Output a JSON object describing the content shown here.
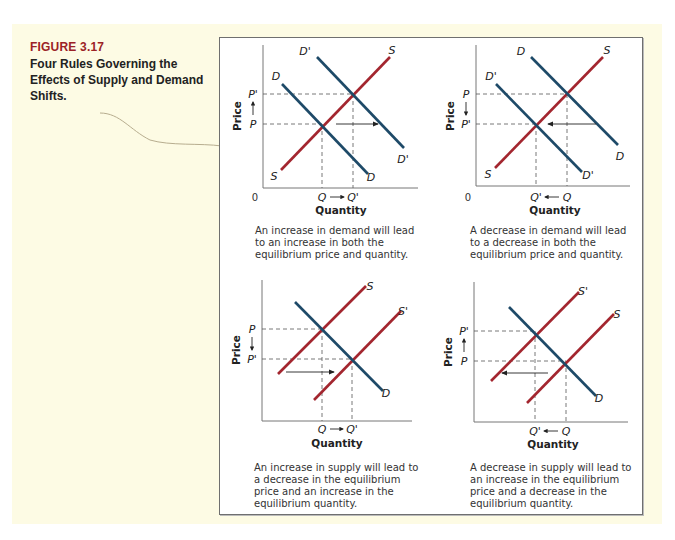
{
  "figure": {
    "number": "FIGURE 3.17",
    "title": "Four Rules Governing the Effects of Supply and Demand Shifts."
  },
  "colors": {
    "supply": "#a3262f",
    "demand": "#1e4a68",
    "figure_number": "#9b2226",
    "background": "#fdfbe4"
  },
  "chart_data": [
    {
      "type": "line",
      "name": "increase-in-demand",
      "xlabel": "Quantity",
      "ylabel": "Price",
      "origin_label": "0",
      "curves": [
        {
          "name": "S",
          "role": "supply",
          "end_labels": [
            "S",
            "S"
          ]
        },
        {
          "name": "D",
          "role": "demand",
          "end_labels": [
            "D",
            "D"
          ]
        },
        {
          "name": "D'",
          "role": "demand",
          "end_labels": [
            "D'",
            "D'"
          ]
        }
      ],
      "price_labels": [
        "P'",
        "P"
      ],
      "price_arrow": "up",
      "quantity_labels": [
        "Q",
        "Q'"
      ],
      "quantity_arrow": "right",
      "shift_arrow": "right",
      "description": "An increase in demand will lead to an increase in both the equilibrium price and quantity."
    },
    {
      "type": "line",
      "name": "decrease-in-demand",
      "xlabel": "Quantity",
      "ylabel": "Price",
      "origin_label": "0",
      "curves": [
        {
          "name": "S",
          "role": "supply",
          "end_labels": [
            "S",
            "S"
          ]
        },
        {
          "name": "D",
          "role": "demand",
          "end_labels": [
            "D",
            "D"
          ]
        },
        {
          "name": "D'",
          "role": "demand",
          "end_labels": [
            "D'",
            "D'"
          ]
        }
      ],
      "price_labels": [
        "P",
        "P'"
      ],
      "price_arrow": "down",
      "quantity_labels": [
        "Q'",
        "Q"
      ],
      "quantity_arrow": "left",
      "shift_arrow": "left",
      "description": "A decrease in demand will lead to a decrease in both the equilibrium price and quantity."
    },
    {
      "type": "line",
      "name": "increase-in-supply",
      "xlabel": "Quantity",
      "ylabel": "Price",
      "curves": [
        {
          "name": "S",
          "role": "supply",
          "end_labels": [
            "S"
          ]
        },
        {
          "name": "S'",
          "role": "supply",
          "end_labels": [
            "S'"
          ]
        },
        {
          "name": "D",
          "role": "demand",
          "end_labels": [
            "D"
          ]
        }
      ],
      "price_labels": [
        "P",
        "P'"
      ],
      "price_arrow": "down",
      "quantity_labels": [
        "Q",
        "Q'"
      ],
      "quantity_arrow": "right",
      "shift_arrow": "right",
      "description": "An increase in supply will lead to a decrease in the equilibrium price and an increase in the equilibrium quantity."
    },
    {
      "type": "line",
      "name": "decrease-in-supply",
      "xlabel": "Quantity",
      "ylabel": "Price",
      "curves": [
        {
          "name": "S'",
          "role": "supply",
          "end_labels": [
            "S'"
          ]
        },
        {
          "name": "S",
          "role": "supply",
          "end_labels": [
            "S"
          ]
        },
        {
          "name": "D",
          "role": "demand",
          "end_labels": [
            "D"
          ]
        }
      ],
      "price_labels": [
        "P'",
        "P"
      ],
      "price_arrow": "up",
      "quantity_labels": [
        "Q'",
        "Q"
      ],
      "quantity_arrow": "left",
      "shift_arrow": "left",
      "description": "A decrease in supply will lead to an increase in the equilibrium price and a decrease in the equilibrium quantity."
    }
  ]
}
